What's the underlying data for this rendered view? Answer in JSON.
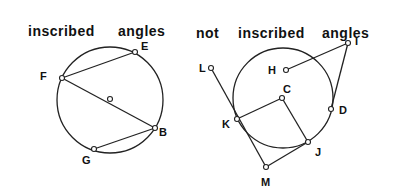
{
  "left_figure": {
    "title_word1": "inscribed",
    "title_word2": "angles",
    "points": {
      "E": "E",
      "F": "F",
      "B": "B",
      "G": "G"
    }
  },
  "right_figure": {
    "title_word1": "not",
    "title_word2": "inscribed",
    "title_word3": "angles",
    "points": {
      "L": "L",
      "H": "H",
      "I": "I",
      "C": "C",
      "K": "K",
      "D": "D",
      "J": "J",
      "M": "M"
    }
  }
}
